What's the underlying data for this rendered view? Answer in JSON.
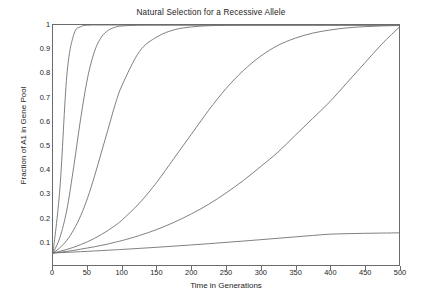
{
  "chart_data": {
    "type": "line",
    "title": "Natural Selection for a Recessive Allele",
    "xlabel": "Time in Generations",
    "ylabel": "Fraction of A1 in Gene Pool",
    "xlim": [
      0,
      500
    ],
    "ylim": [
      0.0,
      1.0
    ],
    "grid": false,
    "legend": "none",
    "line_color": "#707070",
    "axis_color": "#6b6b6b",
    "background": "#ffffff",
    "xticks": [
      0,
      50,
      100,
      150,
      200,
      250,
      300,
      350,
      400,
      450,
      500
    ],
    "xtick_labels": [
      "0",
      "50",
      "100",
      "150",
      "200",
      "250",
      "300",
      "350",
      "400",
      "450",
      "500"
    ],
    "yticks": [
      0.1,
      0.2,
      0.3,
      0.4,
      0.5,
      0.6,
      0.7,
      0.8,
      0.9,
      1
    ],
    "ytick_labels": [
      "0.1",
      "0.2",
      "0.3",
      "0.4",
      "0.5",
      "0.6",
      "0.7",
      "0.8",
      "0.9",
      "1"
    ],
    "initial_fraction": 0.05,
    "x": [
      0,
      10,
      20,
      30,
      40,
      50,
      60,
      70,
      80,
      90,
      100,
      125,
      150,
      175,
      200,
      225,
      250,
      275,
      300,
      325,
      350,
      375,
      400,
      425,
      450,
      475,
      500
    ],
    "series": [
      {
        "name": "curve-1",
        "half_point_generations": 14,
        "values_at_500": 1.0,
        "values": [
          0.05,
          0.32,
          0.79,
          0.96,
          0.993,
          0.999,
          1.0,
          1.0,
          1.0,
          1.0,
          1.0,
          1.0,
          1.0,
          1.0,
          1.0,
          1.0,
          1.0,
          1.0,
          1.0,
          1.0,
          1.0,
          1.0,
          1.0,
          1.0,
          1.0,
          1.0,
          1.0
        ]
      },
      {
        "name": "curve-2",
        "half_point_generations": 38,
        "values_at_500": 1.0,
        "values": [
          0.05,
          0.115,
          0.23,
          0.41,
          0.61,
          0.78,
          0.89,
          0.95,
          0.978,
          0.991,
          0.996,
          0.9995,
          1.0,
          1.0,
          1.0,
          1.0,
          1.0,
          1.0,
          1.0,
          1.0,
          1.0,
          1.0,
          1.0,
          1.0,
          1.0,
          1.0,
          1.0
        ]
      },
      {
        "name": "curve-3",
        "half_point_generations": 72,
        "values_at_500": 1.0,
        "values": [
          0.05,
          0.072,
          0.103,
          0.147,
          0.205,
          0.28,
          0.37,
          0.47,
          0.57,
          0.67,
          0.75,
          0.89,
          0.95,
          0.98,
          0.992,
          0.997,
          0.999,
          1.0,
          1.0,
          1.0,
          1.0,
          1.0,
          1.0,
          1.0,
          1.0,
          1.0,
          1.0
        ]
      },
      {
        "name": "curve-4",
        "half_point_generations": 193,
        "values_at_500": 1.0,
        "values": [
          0.05,
          0.057,
          0.065,
          0.074,
          0.085,
          0.097,
          0.111,
          0.127,
          0.145,
          0.165,
          0.188,
          0.258,
          0.345,
          0.445,
          0.545,
          0.645,
          0.735,
          0.81,
          0.87,
          0.915,
          0.945,
          0.966,
          0.979,
          0.988,
          0.993,
          0.996,
          0.998
        ]
      },
      {
        "name": "curve-5",
        "half_point_generations": 395,
        "values_at_500": 0.99,
        "values": [
          0.05,
          0.053,
          0.057,
          0.061,
          0.066,
          0.071,
          0.076,
          0.082,
          0.088,
          0.095,
          0.102,
          0.123,
          0.148,
          0.178,
          0.213,
          0.253,
          0.3,
          0.352,
          0.41,
          0.47,
          0.54,
          0.61,
          0.68,
          0.76,
          0.84,
          0.92,
          0.99
        ]
      },
      {
        "name": "curve-6",
        "half_point_generations": null,
        "values_at_500": 0.125,
        "values": [
          0.05,
          0.0513,
          0.0527,
          0.0541,
          0.0555,
          0.057,
          0.0585,
          0.06,
          0.0616,
          0.0632,
          0.0649,
          0.0692,
          0.0738,
          0.0786,
          0.0836,
          0.0888,
          0.0942,
          0.0998,
          0.1055,
          0.1113,
          0.1172,
          0.123,
          0.1285,
          0.1305,
          0.132,
          0.133,
          0.134
        ]
      }
    ]
  }
}
